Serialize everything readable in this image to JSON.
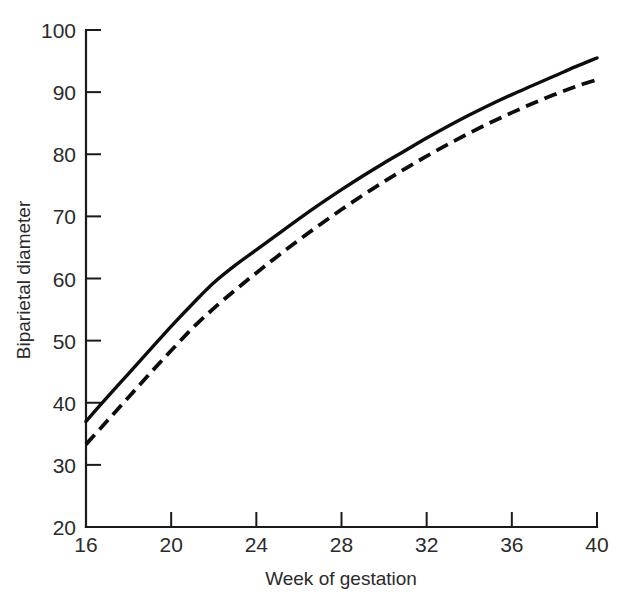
{
  "chart_data": {
    "type": "line",
    "title": "",
    "xlabel": "Week of gestation",
    "ylabel": "Biparietal diameter",
    "xlim": [
      16,
      40
    ],
    "ylim": [
      20,
      100
    ],
    "xticks": [
      16,
      20,
      24,
      28,
      32,
      36,
      40
    ],
    "yticks": [
      20,
      30,
      40,
      50,
      60,
      70,
      80,
      90,
      100
    ],
    "grid": false,
    "legend": "none",
    "x": [
      16,
      17,
      18,
      19,
      20,
      21,
      22,
      23,
      24,
      25,
      26,
      27,
      28,
      29,
      30,
      31,
      32,
      33,
      34,
      35,
      36,
      37,
      38,
      39,
      40
    ],
    "series": [
      {
        "name": "solid-curve",
        "style": "solid",
        "color": "#0d0d0d",
        "values": [
          37.0,
          40.9,
          44.7,
          48.5,
          52.3,
          55.9,
          59.3,
          62.1,
          64.6,
          67.1,
          69.6,
          72.0,
          74.3,
          76.5,
          78.6,
          80.6,
          82.6,
          84.5,
          86.3,
          88.0,
          89.6,
          91.1,
          92.6,
          94.1,
          95.5
        ]
      },
      {
        "name": "dashed-curve",
        "style": "dashed",
        "color": "#0d0d0d",
        "values": [
          33.3,
          37.1,
          40.9,
          44.7,
          48.4,
          52.0,
          55.2,
          58.1,
          60.9,
          63.6,
          66.2,
          68.7,
          71.1,
          73.4,
          75.6,
          77.7,
          79.7,
          81.6,
          83.4,
          85.1,
          86.7,
          88.2,
          89.6,
          90.9,
          92.0
        ]
      }
    ]
  },
  "axes": {
    "x_tick_labels": [
      "16",
      "20",
      "24",
      "28",
      "32",
      "36",
      "40"
    ],
    "y_tick_labels": [
      "20",
      "30",
      "40",
      "50",
      "60",
      "70",
      "80",
      "90",
      "100"
    ],
    "x_axis_title": "Week of gestation",
    "y_axis_title": "Biparietal diameter"
  }
}
